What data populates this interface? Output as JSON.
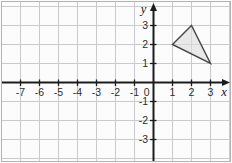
{
  "chart_data": {
    "type": "scatter",
    "title": "",
    "xlabel": "x",
    "ylabel": "y",
    "grid": true,
    "x_axis": {
      "label": "x",
      "range": [
        -8,
        4
      ],
      "ticks": [
        -7,
        -6,
        -5,
        -4,
        -3,
        -2,
        -1,
        1,
        2,
        3
      ],
      "origin_label": "0"
    },
    "y_axis": {
      "label": "y",
      "range": [
        -4,
        4
      ],
      "ticks": [
        3,
        2,
        1,
        -1,
        -2,
        -3
      ]
    },
    "shapes": [
      {
        "name": "triangle",
        "vertices": [
          [
            1,
            2
          ],
          [
            2,
            3
          ],
          [
            3,
            1
          ]
        ]
      }
    ]
  },
  "colors": {
    "background": "#fcfcfc",
    "border": "#b3b3b3",
    "grid": "#c9cacc",
    "axis": "#1c1c1c",
    "tick_text": "#2e2e2e",
    "shape_fill": "#dcdcdc",
    "shape_fill_opacity": "0.6",
    "shape_stroke": "#474747"
  }
}
